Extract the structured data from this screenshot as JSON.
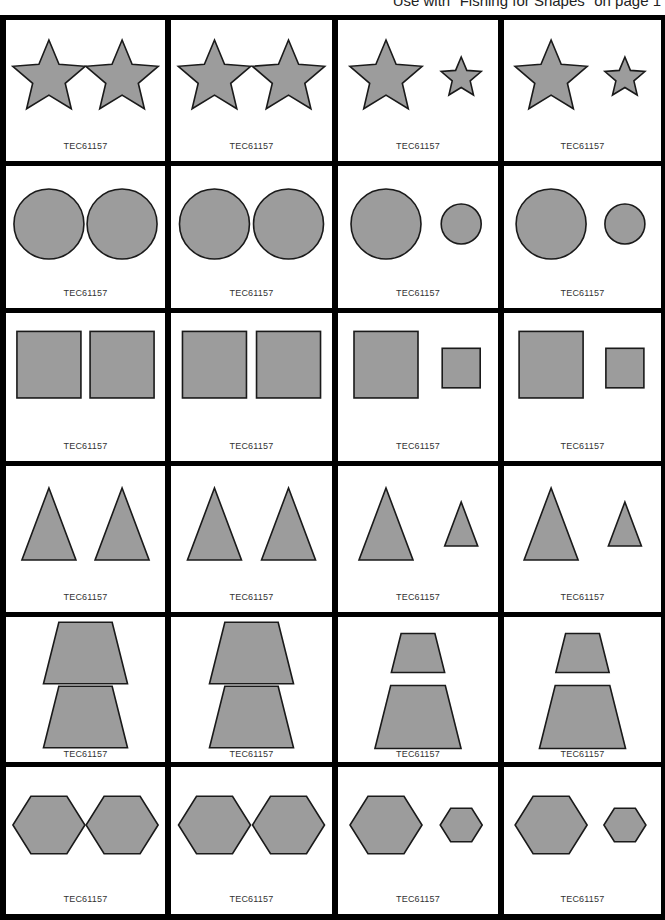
{
  "header": {
    "note": "Use with \"Fishing for Shapes\" on page 1"
  },
  "colors": {
    "shape_fill": "#9c9c9c",
    "shape_stroke": "#1a1a1a",
    "grid_line": "#000000",
    "card_bg": "#ffffff"
  },
  "grid": {
    "columns": 4,
    "rows": 6
  },
  "cards": [
    {
      "row": 1,
      "col": 1,
      "shape": "star",
      "pair": "same-size",
      "code": "TEC61157"
    },
    {
      "row": 1,
      "col": 2,
      "shape": "star",
      "pair": "same-size",
      "code": "TEC61157"
    },
    {
      "row": 1,
      "col": 3,
      "shape": "star",
      "pair": "big-small",
      "code": "TEC61157"
    },
    {
      "row": 1,
      "col": 4,
      "shape": "star",
      "pair": "big-small",
      "code": "TEC61157"
    },
    {
      "row": 2,
      "col": 1,
      "shape": "circle",
      "pair": "same-size",
      "code": "TEC61157"
    },
    {
      "row": 2,
      "col": 2,
      "shape": "circle",
      "pair": "same-size",
      "code": "TEC61157"
    },
    {
      "row": 2,
      "col": 3,
      "shape": "circle",
      "pair": "big-small",
      "code": "TEC61157"
    },
    {
      "row": 2,
      "col": 4,
      "shape": "circle",
      "pair": "big-small",
      "code": "TEC61157"
    },
    {
      "row": 3,
      "col": 1,
      "shape": "square",
      "pair": "same-size",
      "code": "TEC61157"
    },
    {
      "row": 3,
      "col": 2,
      "shape": "square",
      "pair": "same-size",
      "code": "TEC61157"
    },
    {
      "row": 3,
      "col": 3,
      "shape": "square",
      "pair": "big-small",
      "code": "TEC61157"
    },
    {
      "row": 3,
      "col": 4,
      "shape": "square",
      "pair": "big-small",
      "code": "TEC61157"
    },
    {
      "row": 4,
      "col": 1,
      "shape": "triangle",
      "pair": "same-size",
      "code": "TEC61157"
    },
    {
      "row": 4,
      "col": 2,
      "shape": "triangle",
      "pair": "same-size",
      "code": "TEC61157"
    },
    {
      "row": 4,
      "col": 3,
      "shape": "triangle",
      "pair": "big-small",
      "code": "TEC61157"
    },
    {
      "row": 4,
      "col": 4,
      "shape": "triangle",
      "pair": "big-small",
      "code": "TEC61157"
    },
    {
      "row": 5,
      "col": 1,
      "shape": "trapezoid",
      "pair": "same-size",
      "code": "TEC61157"
    },
    {
      "row": 5,
      "col": 2,
      "shape": "trapezoid",
      "pair": "same-size",
      "code": "TEC61157"
    },
    {
      "row": 5,
      "col": 3,
      "shape": "trapezoid",
      "pair": "small-big",
      "code": "TEC61157"
    },
    {
      "row": 5,
      "col": 4,
      "shape": "trapezoid",
      "pair": "small-big",
      "code": "TEC61157"
    },
    {
      "row": 6,
      "col": 1,
      "shape": "hexagon",
      "pair": "same-size",
      "code": "TEC61157"
    },
    {
      "row": 6,
      "col": 2,
      "shape": "hexagon",
      "pair": "same-size",
      "code": "TEC61157"
    },
    {
      "row": 6,
      "col": 3,
      "shape": "hexagon",
      "pair": "big-small",
      "code": "TEC61157"
    },
    {
      "row": 6,
      "col": 4,
      "shape": "hexagon",
      "pair": "big-small",
      "code": "TEC61157"
    }
  ]
}
